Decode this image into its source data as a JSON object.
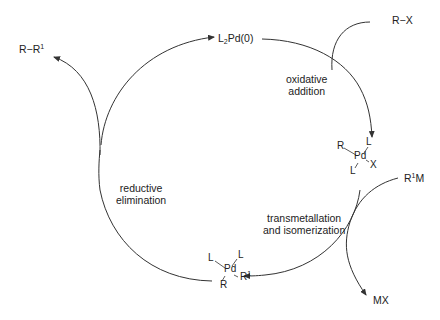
{
  "diagram": {
    "type": "catalytic-cycle",
    "species": {
      "catalyst": {
        "prefix": "L",
        "sub": "2",
        "suffix": "Pd(0)"
      },
      "reactant_rx": "R−X",
      "product": {
        "base": "R−R",
        "sup": "1"
      },
      "reagent": {
        "sup": "1",
        "base_prefix": "R",
        "base_suffix": "M"
      },
      "byproduct": "MX",
      "oxidative_complex": {
        "center": "Pd",
        "top_right": "L",
        "top_left": "R",
        "bottom_left": "L",
        "right": "X"
      },
      "trans_complex": {
        "center": "Pd",
        "top_left": "L",
        "top_right": "L",
        "bottom_left": "R",
        "right_base": "R",
        "right_sup": "1"
      }
    },
    "steps": {
      "oxidative_addition": [
        "oxidative",
        "addition"
      ],
      "transmetallation": [
        "transmetallation",
        "and isomerization"
      ],
      "reductive_elimination": [
        "reductive",
        "elimination"
      ]
    },
    "line_color": "#333333",
    "background": "#ffffff"
  }
}
